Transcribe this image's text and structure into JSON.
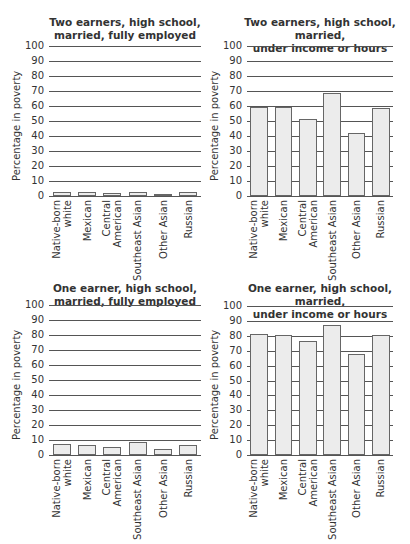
{
  "chart_data": [
    {
      "type": "bar",
      "title": "Two earners, high school, married, fully employed",
      "title_lines": [
        "Two earners, high school,",
        "married, fully employed"
      ],
      "xlabel": "",
      "ylabel": "Percentage in poverty",
      "ylim": [
        0,
        100
      ],
      "yticks": [
        0,
        10,
        20,
        30,
        40,
        50,
        60,
        70,
        80,
        90,
        100
      ],
      "grid": true,
      "categories": [
        "Native-born white",
        "Mexican",
        "Central American",
        "Southeast Asian",
        "Other Asian",
        "Russian"
      ],
      "category_lines": [
        [
          "Native-born",
          "white"
        ],
        [
          "Mexican"
        ],
        [
          "Central",
          "American"
        ],
        [
          "Southeast Asian"
        ],
        [
          "Other Asian"
        ],
        [
          "Russian"
        ]
      ],
      "values": [
        2.5,
        2.5,
        2,
        3,
        1.5,
        2.5
      ]
    },
    {
      "type": "bar",
      "title": "Two earners, high school, married, under income or hours",
      "title_lines": [
        "Two earners, high school, married,",
        "under income or hours"
      ],
      "xlabel": "",
      "ylabel": "Percentage in poverty",
      "ylim": [
        0,
        100
      ],
      "yticks": [
        0,
        10,
        20,
        30,
        40,
        50,
        60,
        70,
        80,
        90,
        100
      ],
      "grid": true,
      "categories": [
        "Native-born white",
        "Mexican",
        "Central American",
        "Southeast Asian",
        "Other Asian",
        "Russian"
      ],
      "category_lines": [
        [
          "Native-born",
          "white"
        ],
        [
          "Mexican"
        ],
        [
          "Central",
          "American"
        ],
        [
          "Southeast Asian"
        ],
        [
          "Other Asian"
        ],
        [
          "Russian"
        ]
      ],
      "values": [
        59.5,
        59.5,
        51.5,
        69,
        42,
        59
      ]
    },
    {
      "type": "bar",
      "title": "One earner, high school, married, fully employed",
      "title_lines": [
        "One earner, high school,",
        "married, fully employed"
      ],
      "xlabel": "",
      "ylabel": "Percentage in poverty",
      "ylim": [
        0,
        100
      ],
      "yticks": [
        0,
        10,
        20,
        30,
        40,
        50,
        60,
        70,
        80,
        90,
        100
      ],
      "grid": true,
      "categories": [
        "Native-born white",
        "Mexican",
        "Central American",
        "Southeast Asian",
        "Other Asian",
        "Russian"
      ],
      "category_lines": [
        [
          "Native-born",
          "white"
        ],
        [
          "Mexican"
        ],
        [
          "Central",
          "American"
        ],
        [
          "Southeast Asian"
        ],
        [
          "Other Asian"
        ],
        [
          "Russian"
        ]
      ],
      "values": [
        7.5,
        7,
        5.5,
        9,
        4,
        6.5
      ]
    },
    {
      "type": "bar",
      "title": "One earner, high school, married, under income or hours",
      "title_lines": [
        "One earner, high school, married,",
        "under income or hours"
      ],
      "xlabel": "",
      "ylabel": "Percentage in poverty",
      "ylim": [
        0,
        100
      ],
      "yticks": [
        0,
        10,
        20,
        30,
        40,
        50,
        60,
        70,
        80,
        90,
        100
      ],
      "grid": true,
      "categories": [
        "Native-born white",
        "Mexican",
        "Central American",
        "Southeast Asian",
        "Other Asian",
        "Russian"
      ],
      "category_lines": [
        [
          "Native-born",
          "white"
        ],
        [
          "Mexican"
        ],
        [
          "Central",
          "American"
        ],
        [
          "Southeast Asian"
        ],
        [
          "Other Asian"
        ],
        [
          "Russian"
        ]
      ],
      "values": [
        81.5,
        80.5,
        76.5,
        87.5,
        68,
        80.5
      ]
    }
  ],
  "colors": {
    "bar_fill": "#ececec",
    "bar_border": "#666666",
    "gridline": "#555555",
    "text": "#333333"
  }
}
